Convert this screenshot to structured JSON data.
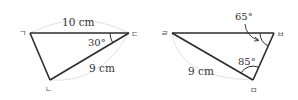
{
  "figures": [
    {
      "name": "triangle-left",
      "vertices": {
        "top_left": "ㄱ",
        "bottom": "ㄴ",
        "top_right": "ㄷ"
      },
      "side_top": "10 cm",
      "side_diagonal": "9 cm",
      "angle": "30°"
    },
    {
      "name": "triangle-right",
      "vertices": {
        "top_left": "ㄹ",
        "bottom": "ㅁ",
        "top_right": "ㅂ"
      },
      "side_diagonal": "9 cm",
      "angle_top": "65°",
      "angle_bottom": "85°"
    }
  ],
  "colors": {
    "line": "#2b2b2b",
    "arc_guide": "#e2e2e2",
    "text": "#333333"
  }
}
